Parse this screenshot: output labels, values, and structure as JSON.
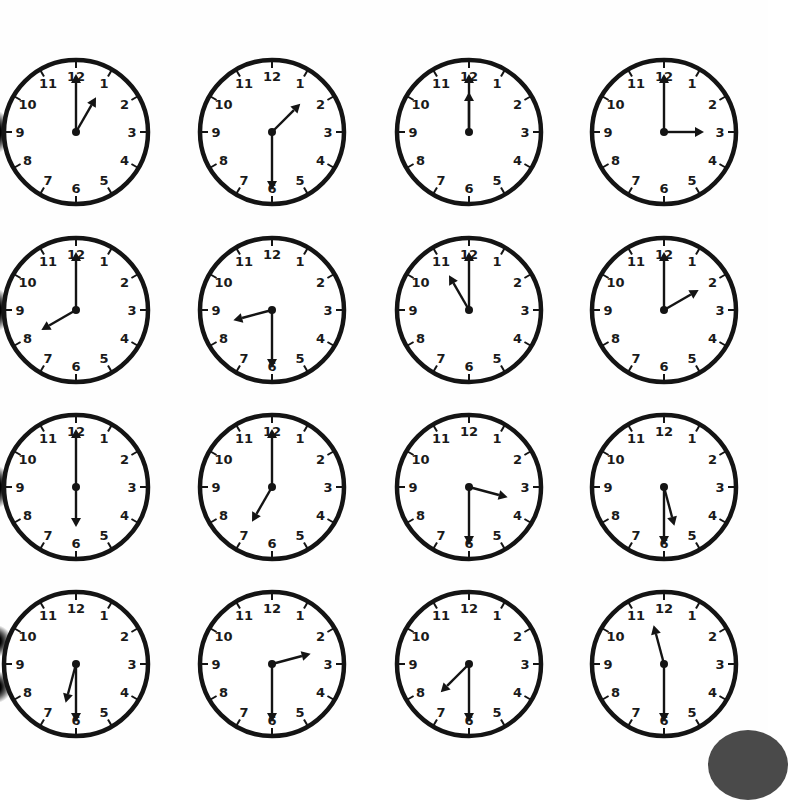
{
  "worksheet": {
    "clock_numbers": [
      "12",
      "1",
      "2",
      "3",
      "4",
      "5",
      "6",
      "7",
      "8",
      "9",
      "10",
      "11"
    ],
    "clocks": [
      {
        "row": 1,
        "col": 1,
        "time": "1:00",
        "hour": 1,
        "minute": 0
      },
      {
        "row": 1,
        "col": 2,
        "time": "1:30",
        "hour": 1,
        "minute": 30
      },
      {
        "row": 1,
        "col": 3,
        "time": "12:00",
        "hour": 12,
        "minute": 0
      },
      {
        "row": 1,
        "col": 4,
        "time": "3:00",
        "hour": 3,
        "minute": 0
      },
      {
        "row": 2,
        "col": 1,
        "time": "8:00",
        "hour": 8,
        "minute": 0
      },
      {
        "row": 2,
        "col": 2,
        "time": "8:30",
        "hour": 8,
        "minute": 30
      },
      {
        "row": 2,
        "col": 3,
        "time": "11:00",
        "hour": 11,
        "minute": 0
      },
      {
        "row": 2,
        "col": 4,
        "time": "2:00",
        "hour": 2,
        "minute": 0
      },
      {
        "row": 3,
        "col": 1,
        "time": "6:00",
        "hour": 6,
        "minute": 0
      },
      {
        "row": 3,
        "col": 2,
        "time": "7:00",
        "hour": 7,
        "minute": 0
      },
      {
        "row": 3,
        "col": 3,
        "time": "3:30",
        "hour": 3,
        "minute": 30
      },
      {
        "row": 3,
        "col": 4,
        "time": "5:30",
        "hour": 5,
        "minute": 30
      },
      {
        "row": 4,
        "col": 1,
        "time": "6:30",
        "hour": 6,
        "minute": 30
      },
      {
        "row": 4,
        "col": 2,
        "time": "2:30",
        "hour": 2,
        "minute": 30
      },
      {
        "row": 4,
        "col": 3,
        "time": "7:30",
        "hour": 7,
        "minute": 30
      },
      {
        "row": 4,
        "col": 4,
        "time": "11:30",
        "hour": 11,
        "minute": 30
      }
    ]
  },
  "colors": {
    "ink": "#141414",
    "background": "#fefefe",
    "corner": "#4a4a4a"
  }
}
